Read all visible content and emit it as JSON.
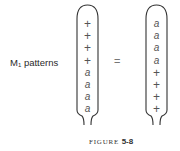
{
  "label": {
    "main": "M",
    "subscript": "1",
    "suffix": " patterns"
  },
  "left_pattern": [
    "+",
    "+",
    "+",
    "+",
    "a",
    "a",
    "a",
    "a"
  ],
  "equals": "=",
  "right_pattern": [
    "a",
    "a",
    "a",
    "a",
    "+",
    "+",
    "+",
    "+"
  ],
  "caption": {
    "word": "FIGURE",
    "number": "5-8"
  }
}
